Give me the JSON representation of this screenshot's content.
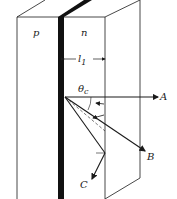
{
  "diagram": {
    "regions": {
      "p_label": "p",
      "n_label": "n"
    },
    "dimension": {
      "label": "l",
      "subscript": "1"
    },
    "angle": {
      "label": "θ",
      "subscript": "c"
    },
    "rays": [
      {
        "id": "A",
        "label": "A"
      },
      {
        "id": "B",
        "label": "B"
      },
      {
        "id": "C",
        "label": "C"
      }
    ],
    "colors": {
      "line": "#1a1a1a",
      "junction": "#111111",
      "background": "#ffffff"
    }
  }
}
